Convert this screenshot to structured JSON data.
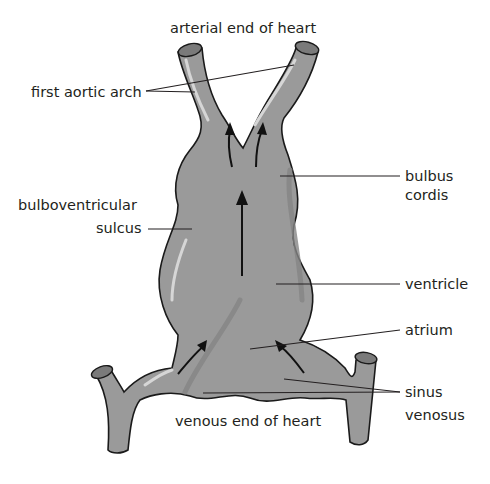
{
  "diagram": {
    "colors": {
      "tissue": "#9a9a9a",
      "outline": "#1a1a1a",
      "text": "#231f20",
      "background": "#ffffff"
    },
    "labels": {
      "arterial_end": "arterial end of heart",
      "first_aortic_arch": "first aortic arch",
      "bulboventricular_line1": "bulboventricular",
      "bulboventricular_line2": "sulcus",
      "bulbus_line1": "bulbus",
      "bulbus_line2": "cordis",
      "ventricle": "ventricle",
      "atrium": "atrium",
      "sinus_line1": "sinus",
      "sinus_line2": "venosus",
      "venous_end": "venous end of heart"
    },
    "arrows": [
      "flow-up-left-branch",
      "flow-up-right-branch",
      "flow-up-center",
      "flow-from-left-horn",
      "flow-from-right-horn"
    ]
  }
}
